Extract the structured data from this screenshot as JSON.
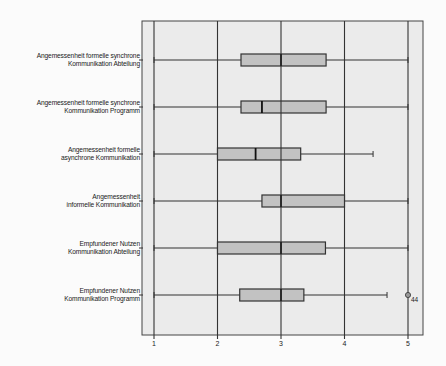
{
  "chart_data": {
    "type": "boxplot",
    "orientation": "horizontal",
    "title": "",
    "xlabel": "",
    "ylabel": "",
    "xlim": [
      0.8,
      5.24
    ],
    "xticks": [
      1,
      2,
      3,
      4,
      5
    ],
    "xtick_labels": [
      "1",
      "2",
      "3",
      "4",
      "5"
    ],
    "grid": "vertical gridlines at each tick",
    "colors": {
      "plot_bg": "#ebebeb",
      "box_fill": "#c2c2c2",
      "lines": "#333333",
      "page_bg": "#fbfbfb"
    },
    "series": [
      {
        "label_line1": "Angemessenheit formelle synchrone",
        "label_line2": "Kommunikation Abteilung",
        "min": 1,
        "q1": 2.37,
        "median": 3.0,
        "q3": 3.71,
        "max": 5,
        "outliers": []
      },
      {
        "label_line1": "Angemessenheit formelle synchrone",
        "label_line2": "Kommunikation Programm",
        "min": 1,
        "q1": 2.37,
        "median": 2.7,
        "q3": 3.71,
        "max": 5,
        "outliers": []
      },
      {
        "label_line1": "Angemessenheit formelle",
        "label_line2": "asynchrone Kommunikation",
        "min": 1,
        "q1": 2.0,
        "median": 2.6,
        "q3": 3.31,
        "max": 4.45,
        "outliers": []
      },
      {
        "label_line1": "Angemessenheit",
        "label_line2": "informelle Kommunikation",
        "min": 1,
        "q1": 2.7,
        "median": 3.0,
        "q3": 4.0,
        "max": 5,
        "outliers": []
      },
      {
        "label_line1": "Empfundener Nutzen",
        "label_line2": "Kommunikation Abteilung",
        "min": 1,
        "q1": 2.0,
        "median": 3.0,
        "q3": 3.7,
        "max": 5,
        "outliers": []
      },
      {
        "label_line1": "Empfundener Nutzen",
        "label_line2": "Kommunikation Programm",
        "min": 1,
        "q1": 2.35,
        "median": 3.0,
        "q3": 3.36,
        "max": 4.67,
        "outliers": [
          {
            "value": 5,
            "label": "44"
          }
        ]
      }
    ]
  }
}
